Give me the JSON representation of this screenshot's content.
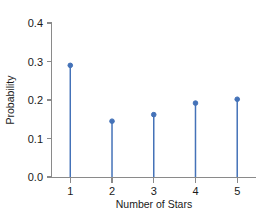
{
  "chart_data": {
    "type": "bar",
    "subtype": "stem-needle-plot",
    "title": "",
    "xlabel": "Number of Stars",
    "ylabel": "Probability",
    "categories": [
      "1",
      "2",
      "3",
      "4",
      "5"
    ],
    "x": [
      1,
      2,
      3,
      4,
      5
    ],
    "values": [
      0.29,
      0.145,
      0.162,
      0.192,
      0.202
    ],
    "xlim": [
      0.55,
      5.45
    ],
    "ylim": [
      0.0,
      0.4
    ],
    "yticks": [
      0.0,
      0.1,
      0.2,
      0.3,
      0.4
    ],
    "ytick_labels": [
      "0.0",
      "0.1",
      "0.2",
      "0.3",
      "0.4"
    ],
    "xticks": [
      1,
      2,
      3,
      4,
      5
    ],
    "xtick_labels": [
      "1",
      "2",
      "3",
      "4",
      "5"
    ],
    "grid": false,
    "legend": false,
    "legend_position": "none",
    "series_color": "#4472b8",
    "marker": "circle",
    "axis_color": "#8a8a8a",
    "text_color": "#1a1a1a",
    "background": "#ffffff",
    "spines": [
      "left",
      "bottom"
    ]
  }
}
